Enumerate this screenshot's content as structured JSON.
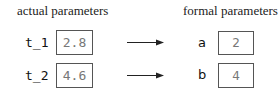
{
  "left_title": "actual parameters",
  "right_title": "formal parameters",
  "rows": [
    {
      "actual_name": "t_1",
      "actual_value": "2.8",
      "formal_name": "a",
      "formal_value": "2"
    },
    {
      "actual_name": "t_2",
      "actual_value": "4.6",
      "formal_name": "b",
      "formal_value": "4"
    }
  ],
  "icons": {
    "arrow": "right-arrow-icon"
  }
}
